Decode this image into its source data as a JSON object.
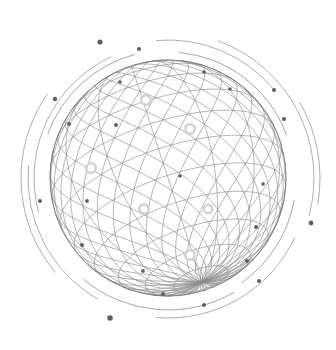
{
  "illustration": {
    "name": "wireframe-globe",
    "width": 336,
    "height": 350,
    "background": "#ffffff",
    "colors": {
      "grid": "#8a8a8a",
      "outline": "#7a7a7a",
      "orbit": "#9a9a9a",
      "dot": "#5f5f5f",
      "glow": "#cfcfcf"
    },
    "globe": {
      "cx": 168,
      "cy": 178,
      "r": 118,
      "tilt": -18,
      "lat_lines": 13,
      "lon_lines": 14
    },
    "orbits": [
      {
        "r": 128,
        "start": 200,
        "end": 255,
        "width": 0.9
      },
      {
        "r": 134,
        "start": 165,
        "end": 245,
        "width": 0.8
      },
      {
        "r": 140,
        "start": 120,
        "end": 185,
        "width": 0.8
      },
      {
        "r": 147,
        "start": 140,
        "end": 215,
        "width": 0.8
      },
      {
        "r": 132,
        "start": 60,
        "end": 130,
        "width": 0.9
      },
      {
        "r": 126,
        "start": 275,
        "end": 340,
        "width": 0.9
      },
      {
        "r": 138,
        "start": 265,
        "end": 320,
        "width": 0.8
      },
      {
        "r": 146,
        "start": 290,
        "end": 375,
        "width": 0.8
      },
      {
        "r": 152,
        "start": 330,
        "end": 370,
        "width": 0.8
      },
      {
        "r": 128,
        "start": 10,
        "end": 55,
        "width": 0.9
      },
      {
        "r": 140,
        "start": 25,
        "end": 95,
        "width": 0.8
      }
    ],
    "dots": [
      {
        "x": 100,
        "y": 42,
        "r": 2.6
      },
      {
        "x": 139,
        "y": 49,
        "r": 2.0
      },
      {
        "x": 55,
        "y": 99,
        "r": 2.2
      },
      {
        "x": 120,
        "y": 82,
        "r": 1.8
      },
      {
        "x": 69,
        "y": 124,
        "r": 2.0
      },
      {
        "x": 116,
        "y": 125,
        "r": 1.9
      },
      {
        "x": 204,
        "y": 72,
        "r": 1.8
      },
      {
        "x": 230,
        "y": 89,
        "r": 1.8
      },
      {
        "x": 274,
        "y": 90,
        "r": 2.1
      },
      {
        "x": 284,
        "y": 119,
        "r": 2.1
      },
      {
        "x": 40,
        "y": 201,
        "r": 2.0
      },
      {
        "x": 87,
        "y": 201,
        "r": 1.9
      },
      {
        "x": 82,
        "y": 245,
        "r": 2.0
      },
      {
        "x": 143,
        "y": 271,
        "r": 1.9
      },
      {
        "x": 163,
        "y": 294,
        "r": 2.0
      },
      {
        "x": 110,
        "y": 318,
        "r": 2.8
      },
      {
        "x": 204,
        "y": 305,
        "r": 2.0
      },
      {
        "x": 180,
        "y": 176,
        "r": 1.8
      },
      {
        "x": 256,
        "y": 227,
        "r": 2.0
      },
      {
        "x": 311,
        "y": 223,
        "r": 2.4
      },
      {
        "x": 247,
        "y": 261,
        "r": 2.0
      },
      {
        "x": 259,
        "y": 281,
        "r": 2.0
      },
      {
        "x": 263,
        "y": 184,
        "r": 1.8
      }
    ],
    "glows": [
      {
        "x": 146,
        "y": 100,
        "r": 4.5
      },
      {
        "x": 190,
        "y": 129,
        "r": 4.5
      },
      {
        "x": 91,
        "y": 168,
        "r": 4.5
      },
      {
        "x": 144,
        "y": 209,
        "r": 4.5
      },
      {
        "x": 208,
        "y": 209,
        "r": 4.0
      },
      {
        "x": 190,
        "y": 255,
        "r": 4.5
      }
    ]
  }
}
